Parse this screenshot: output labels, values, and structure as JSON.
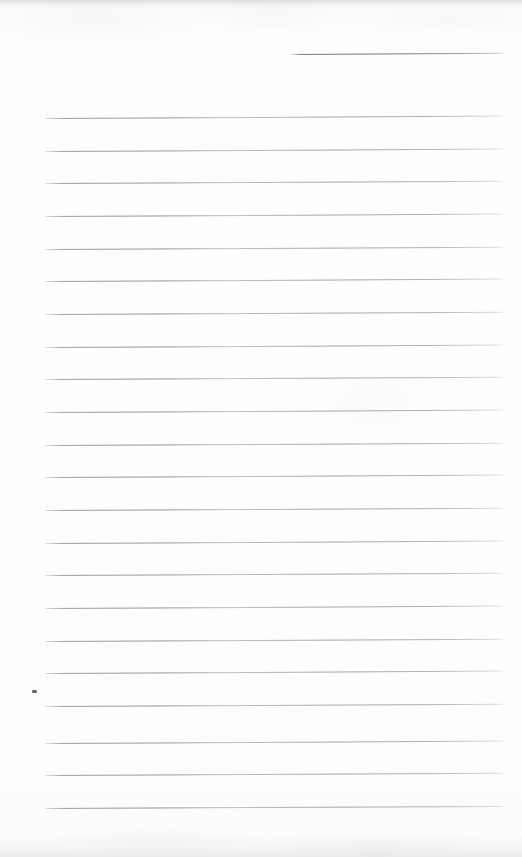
{
  "page": {
    "kind": "scanned-ruled-notebook-page",
    "title": "",
    "visible_text": "",
    "width": 522,
    "height": 857,
    "background_color": "#fdfdfd",
    "rule_color": "#9a9aa0",
    "rule_color_strong": "#8e8e96",
    "ink_speck_color": "#4a4a4f",
    "scan_edge_color": "#cdcdd1"
  },
  "ruling": {
    "line_count": 24,
    "spacing_px": 32.7,
    "left_margin_px": 45,
    "right_margin_px": 506,
    "line_thickness_px": 1,
    "has_vertical_margin_rule": false,
    "first_line_is_partial": true,
    "first_line_start_x_px": 290
  },
  "lines": [
    {
      "index": 1,
      "y": 54,
      "x1": 290,
      "x2": 506,
      "partial": true,
      "slant_deg": -0.35
    },
    {
      "index": 2,
      "y": 118,
      "x1": 45,
      "x2": 506,
      "partial": false,
      "slant_deg": -0.3
    },
    {
      "index": 3,
      "y": 151,
      "x1": 45,
      "x2": 506,
      "partial": false,
      "slant_deg": -0.3
    },
    {
      "index": 4,
      "y": 183,
      "x1": 45,
      "x2": 506,
      "partial": false,
      "slant_deg": -0.28
    },
    {
      "index": 5,
      "y": 216,
      "x1": 45,
      "x2": 506,
      "partial": false,
      "slant_deg": -0.3
    },
    {
      "index": 6,
      "y": 249,
      "x1": 45,
      "x2": 506,
      "partial": false,
      "slant_deg": -0.28
    },
    {
      "index": 7,
      "y": 281,
      "x1": 45,
      "x2": 506,
      "partial": false,
      "slant_deg": -0.3
    },
    {
      "index": 8,
      "y": 314,
      "x1": 45,
      "x2": 506,
      "partial": false,
      "slant_deg": -0.28
    },
    {
      "index": 9,
      "y": 347,
      "x1": 45,
      "x2": 506,
      "partial": false,
      "slant_deg": -0.3
    },
    {
      "index": 10,
      "y": 379,
      "x1": 45,
      "x2": 506,
      "partial": false,
      "slant_deg": -0.28
    },
    {
      "index": 11,
      "y": 412,
      "x1": 45,
      "x2": 506,
      "partial": false,
      "slant_deg": -0.3
    },
    {
      "index": 12,
      "y": 445,
      "x1": 45,
      "x2": 506,
      "partial": false,
      "slant_deg": -0.28
    },
    {
      "index": 13,
      "y": 477,
      "x1": 45,
      "x2": 506,
      "partial": false,
      "slant_deg": -0.3
    },
    {
      "index": 14,
      "y": 510,
      "x1": 45,
      "x2": 506,
      "partial": false,
      "slant_deg": -0.28
    },
    {
      "index": 15,
      "y": 543,
      "x1": 45,
      "x2": 506,
      "partial": false,
      "slant_deg": -0.3
    },
    {
      "index": 16,
      "y": 575,
      "x1": 45,
      "x2": 506,
      "partial": false,
      "slant_deg": -0.28
    },
    {
      "index": 17,
      "y": 608,
      "x1": 45,
      "x2": 506,
      "partial": false,
      "slant_deg": -0.3
    },
    {
      "index": 18,
      "y": 641,
      "x1": 45,
      "x2": 506,
      "partial": false,
      "slant_deg": -0.28
    },
    {
      "index": 19,
      "y": 673,
      "x1": 45,
      "x2": 506,
      "partial": false,
      "slant_deg": -0.3
    },
    {
      "index": 20,
      "y": 706,
      "x1": 45,
      "x2": 506,
      "partial": false,
      "slant_deg": -0.28
    },
    {
      "index": 21,
      "y": 743,
      "x1": 45,
      "x2": 506,
      "partial": false,
      "slant_deg": -0.3
    },
    {
      "index": 22,
      "y": 775,
      "x1": 45,
      "x2": 506,
      "partial": false,
      "slant_deg": -0.28
    },
    {
      "index": 23,
      "y": 808,
      "x1": 45,
      "x2": 506,
      "partial": false,
      "slant_deg": -0.26
    }
  ],
  "artifacts": {
    "ink_speck": {
      "x": 32,
      "y": 690,
      "width": 5,
      "height": 3
    },
    "scan_edge_top": {
      "y": 0,
      "height": 9
    },
    "scan_edge_bottom": {
      "y": 833,
      "height": 24
    }
  }
}
